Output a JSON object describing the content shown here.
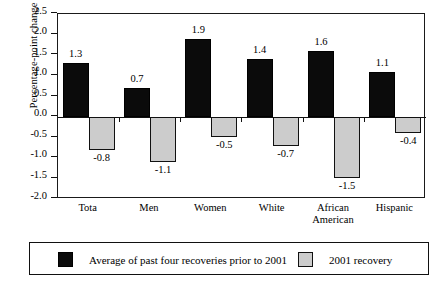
{
  "chart_data": {
    "type": "bar",
    "title": "",
    "xlabel": "",
    "ylabel": "Percentage-point change",
    "ylim": [
      -2.0,
      2.5
    ],
    "ytick_labels": [
      "2.5",
      "2.0",
      "1.5",
      "1.0",
      "0.5",
      "0.0",
      "-0.5",
      "-1.0",
      "-1.5",
      "-2.0"
    ],
    "ytick_values": [
      2.5,
      2.0,
      1.5,
      1.0,
      0.5,
      0.0,
      -0.5,
      -1.0,
      -1.5,
      -2.0
    ],
    "grid": false,
    "legend_position": "bottom",
    "categories": [
      "Tota",
      "Men",
      "Women",
      "White",
      "African\nAmerican",
      "Hispanic"
    ],
    "series": [
      {
        "name": "Average of past four recoveries prior to 2001",
        "color": "#0b0b0b",
        "values": [
          1.3,
          0.7,
          1.9,
          1.4,
          1.6,
          1.1
        ],
        "labels": [
          "1.3",
          "0.7",
          "1.9",
          "1.4",
          "1.6",
          "1.1"
        ]
      },
      {
        "name": "2001 recovery",
        "color": "#cccccc",
        "values": [
          -0.8,
          -1.1,
          -0.5,
          -0.7,
          -1.5,
          -0.4
        ],
        "labels": [
          "-0.8",
          "-1.1",
          "-0.5",
          "-0.7",
          "-1.5",
          "-0.4"
        ]
      }
    ]
  },
  "legend": {
    "items": [
      {
        "label": "Average of past four recoveries prior to 2001",
        "swatch": "black"
      },
      {
        "label": "2001 recovery",
        "swatch": "gray"
      }
    ]
  }
}
